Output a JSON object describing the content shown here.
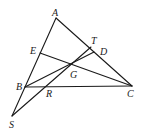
{
  "diagram": {
    "type": "geometry",
    "points": {
      "A": {
        "x": 56,
        "y": 18
      },
      "B": {
        "x": 25,
        "y": 87
      },
      "C": {
        "x": 132,
        "y": 86
      },
      "D": {
        "x": 94,
        "y": 52
      },
      "E": {
        "x": 40,
        "y": 53
      },
      "G": {
        "x": 71,
        "y": 64
      },
      "R": {
        "x": 47,
        "y": 87
      },
      "S": {
        "x": 12,
        "y": 116
      },
      "T": {
        "x": 91,
        "y": 47
      }
    },
    "labels": [
      {
        "text": "A",
        "x": 52,
        "y": 16
      },
      {
        "text": "E",
        "x": 30,
        "y": 54
      },
      {
        "text": "T",
        "x": 91,
        "y": 44
      },
      {
        "text": "D",
        "x": 100,
        "y": 55
      },
      {
        "text": "G",
        "x": 70,
        "y": 78
      },
      {
        "text": "B",
        "x": 16,
        "y": 90
      },
      {
        "text": "R",
        "x": 46,
        "y": 97
      },
      {
        "text": "C",
        "x": 127,
        "y": 97
      },
      {
        "text": "S",
        "x": 9,
        "y": 128
      }
    ],
    "segments": [
      [
        "A",
        "S"
      ],
      [
        "A",
        "C"
      ],
      [
        "B",
        "C"
      ],
      [
        "E",
        "C"
      ],
      [
        "B",
        "D"
      ],
      [
        "S",
        "T"
      ]
    ]
  }
}
